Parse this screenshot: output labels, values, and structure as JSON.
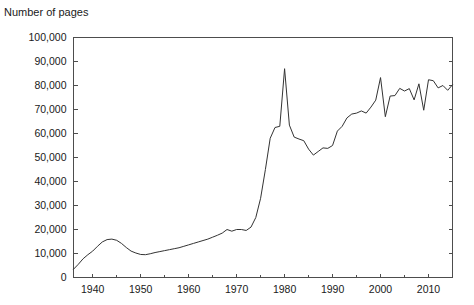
{
  "chart_data": {
    "type": "line",
    "title": "Number of pages",
    "subtitle": "",
    "xlabel": "",
    "ylabel": "Number of pages",
    "xlim": [
      1936,
      2015
    ],
    "ylim": [
      0,
      100000
    ],
    "grid": false,
    "legend": false,
    "legend_position": "none",
    "line_color": "#333333",
    "axis_color": "#4d4d4d",
    "background_color": "#ffffff",
    "y_ticks": [
      0,
      10000,
      20000,
      30000,
      40000,
      50000,
      60000,
      70000,
      80000,
      90000,
      100000
    ],
    "y_tick_labels": [
      "0",
      "10,000",
      "20,000",
      "30,000",
      "40,000",
      "50,000",
      "60,000",
      "70,000",
      "80,000",
      "90,000",
      "100,000"
    ],
    "x_ticks": [
      1940,
      1950,
      1960,
      1970,
      1980,
      1990,
      2000,
      2010
    ],
    "x_tick_labels": [
      "1940",
      "1950",
      "1960",
      "1970",
      "1980",
      "1990",
      "2000",
      "2010"
    ],
    "x_minor_ticks": [
      1945,
      1955,
      1965,
      1975,
      1985,
      1995,
      2005,
      2015
    ],
    "series": [
      {
        "name": "Number of pages",
        "x": [
          1936,
          1937,
          1938,
          1939,
          1940,
          1941,
          1942,
          1943,
          1944,
          1945,
          1946,
          1947,
          1948,
          1949,
          1950,
          1951,
          1952,
          1953,
          1954,
          1955,
          1956,
          1957,
          1958,
          1959,
          1960,
          1961,
          1962,
          1963,
          1964,
          1965,
          1966,
          1967,
          1968,
          1969,
          1970,
          1971,
          1972,
          1973,
          1974,
          1975,
          1976,
          1977,
          1978,
          1979,
          1980,
          1981,
          1982,
          1983,
          1984,
          1985,
          1986,
          1987,
          1988,
          1989,
          1990,
          1991,
          1992,
          1993,
          1994,
          1995,
          1996,
          1997,
          1998,
          1999,
          2000,
          2001,
          2002,
          2003,
          2004,
          2005,
          2006,
          2007,
          2008,
          2009,
          2010,
          2011,
          2012,
          2013,
          2014,
          2015
        ],
        "values": [
          3450,
          5500,
          7800,
          9500,
          11000,
          13000,
          14800,
          15800,
          16000,
          15500,
          14200,
          12500,
          11000,
          10200,
          9600,
          9500,
          9900,
          10400,
          10800,
          11200,
          11600,
          12000,
          12400,
          13000,
          13600,
          14200,
          14800,
          15400,
          16000,
          16800,
          17600,
          18500,
          20000,
          19300,
          20000,
          20000,
          19600,
          21000,
          25000,
          33000,
          45000,
          58000,
          62500,
          63000,
          87000,
          63500,
          58500,
          57700,
          57000,
          53500,
          51000,
          52500,
          54000,
          53800,
          55000,
          61000,
          63000,
          66500,
          68100,
          68500,
          69400,
          68500,
          71000,
          73900,
          83300,
          67000,
          75600,
          75800,
          78800,
          77700,
          78700,
          74000,
          80700,
          69700,
          82400,
          82000,
          79000,
          80000,
          78000,
          80300
        ]
      }
    ],
    "annotations": []
  }
}
